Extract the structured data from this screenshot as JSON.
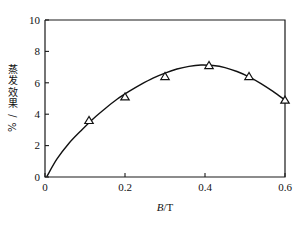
{
  "chart_data": {
    "type": "line",
    "title": "",
    "xlabel": "B/T",
    "xlabel_italic_part": "B",
    "xlabel_rest": "/T",
    "ylabel": "蒸发效果/%",
    "xlim": [
      0,
      0.6
    ],
    "ylim": [
      0,
      10
    ],
    "xticks": [
      0,
      0.2,
      0.4,
      0.6
    ],
    "xtick_labels": [
      "0",
      "0.2",
      "0.4",
      "0.6"
    ],
    "yticks": [
      0,
      2,
      4,
      6,
      8,
      10
    ],
    "ytick_labels": [
      "0",
      "2",
      "4",
      "6",
      "8",
      "10"
    ],
    "grid": false,
    "legend": null,
    "marker_style": "open-triangle",
    "series": [
      {
        "name": "蒸发效果",
        "marker": "triangle",
        "x": [
          0.11,
          0.2,
          0.3,
          0.41,
          0.51,
          0.6
        ],
        "values": [
          3.6,
          5.1,
          6.4,
          7.1,
          6.4,
          4.9
        ]
      }
    ],
    "fit_curve": {
      "description": "smooth fitted curve through origin rising to peak near B=0.39 then falling",
      "x": [
        0.005,
        0.03,
        0.06,
        0.09,
        0.12,
        0.15,
        0.18,
        0.21,
        0.24,
        0.27,
        0.3,
        0.33,
        0.36,
        0.39,
        0.42,
        0.45,
        0.48,
        0.51,
        0.54,
        0.57,
        0.6
      ],
      "y": [
        0.05,
        1.15,
        2.15,
        2.95,
        3.7,
        4.35,
        4.95,
        5.45,
        5.9,
        6.3,
        6.62,
        6.88,
        7.05,
        7.13,
        7.1,
        6.97,
        6.72,
        6.38,
        5.95,
        5.45,
        4.9
      ]
    },
    "colors": {
      "axis": "#1a1a1a",
      "curve": "#111111",
      "marker_fill": "#ffffff",
      "marker_edge": "#111111",
      "background": "#ffffff"
    }
  }
}
